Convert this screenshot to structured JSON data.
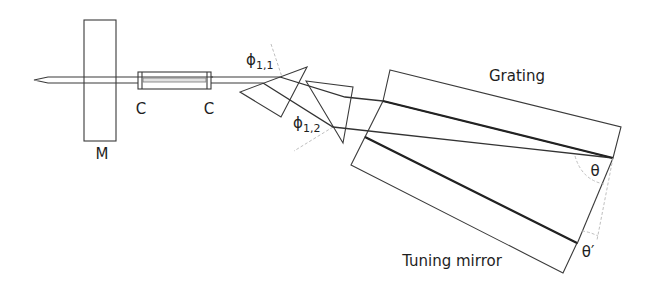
{
  "diagram": {
    "labels": {
      "mirror": "M",
      "collimator_left": "C",
      "collimator_right": "C",
      "phi_11_symbol": "ϕ",
      "phi_11_sub": "1,1",
      "phi_12_symbol": "ϕ",
      "phi_12_sub": "1,2",
      "grating": "Grating",
      "tuning_mirror": "Tuning mirror",
      "theta": "θ",
      "theta_prime": "θ′"
    },
    "colors": {
      "stroke": "#3a3a3a",
      "surface": "#222222",
      "normal_dashed": "#b8b8b8",
      "background": "#ffffff"
    }
  }
}
